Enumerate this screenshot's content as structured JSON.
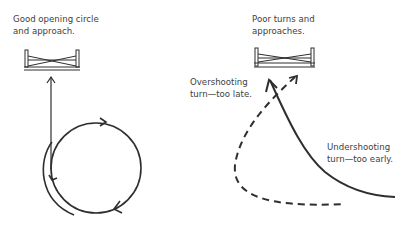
{
  "left_panel": {
    "caption_line1": "Good opening circle",
    "caption_line2": "and approach."
  },
  "right_panel": {
    "caption_line1": "Poor turns and",
    "caption_line2": "approaches.",
    "overshoot_line1": "Overshooting",
    "overshoot_line2": "turn—too late.",
    "undershoot_line1": "Undershooting",
    "undershoot_line2": "turn—too early."
  },
  "colors": {
    "ink": "#2e2e2e",
    "text": "#404040",
    "background": "#ffffff"
  }
}
